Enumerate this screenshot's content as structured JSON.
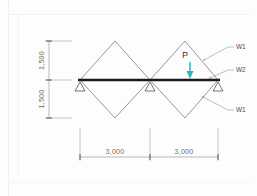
{
  "figure": {
    "beam_color": "#1a1a1a",
    "member_color": "#6b6b6b",
    "dim_color": "#8a8a8a",
    "load_color": "#2fb3c4",
    "text_color": "#4a4a4a"
  },
  "dimensions": {
    "vertical": [
      {
        "id": "v-top",
        "value": "1,500"
      },
      {
        "id": "v-bottom",
        "value": "1,500"
      }
    ],
    "horizontal": [
      {
        "id": "h-left",
        "value": "3,000"
      },
      {
        "id": "h-right",
        "value": "3,000"
      }
    ]
  },
  "labels": {
    "load": "P",
    "members": [
      {
        "id": "w1-top",
        "text": "W1"
      },
      {
        "id": "w2-mid",
        "text": "W2"
      },
      {
        "id": "w1-bottom",
        "text": "W1"
      }
    ]
  },
  "supports": [
    {
      "id": "support-left",
      "type": "pin-triangle"
    },
    {
      "id": "support-center",
      "type": "pin-triangle"
    },
    {
      "id": "support-right",
      "type": "pin-triangle"
    }
  ]
}
